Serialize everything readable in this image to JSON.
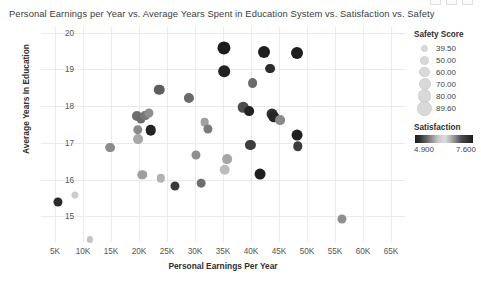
{
  "window": {
    "buttons": [
      "minimize",
      "maximize",
      "close"
    ]
  },
  "chart_data": {
    "type": "scatter",
    "title": "Personal Earnings per Year vs. Average Years Spent in Education System vs. Satisfaction vs. Safety",
    "xlabel": "Personal Earnings Per Year",
    "ylabel": "Average Years In Education",
    "xlim": [
      2500,
      67500
    ],
    "ylim": [
      14.3,
      20.15
    ],
    "grid": true,
    "xticks": [
      "5K",
      "10K",
      "15K",
      "20K",
      "25K",
      "30K",
      "35K",
      "40K",
      "45K",
      "50K",
      "55K",
      "60K",
      "65K"
    ],
    "xtick_values": [
      5000,
      10000,
      15000,
      20000,
      25000,
      30000,
      35000,
      40000,
      45000,
      50000,
      55000,
      60000,
      65000
    ],
    "yticks": [
      "15",
      "16",
      "17",
      "18",
      "19",
      "20"
    ],
    "ytick_values": [
      15,
      16,
      17,
      18,
      19,
      20
    ],
    "size_encoding": "Safety Score",
    "color_encoding": "Satisfaction",
    "points": [
      {
        "x": 5500,
        "y": 15.4,
        "size": 62,
        "color": "#2a2a2a"
      },
      {
        "x": 8600,
        "y": 15.58,
        "size": 52,
        "color": "#cdcdcd"
      },
      {
        "x": 11200,
        "y": 14.37,
        "size": 46,
        "color": "#c4c4c4"
      },
      {
        "x": 14900,
        "y": 16.87,
        "size": 66,
        "color": "#8c8c8c"
      },
      {
        "x": 19700,
        "y": 17.72,
        "size": 68,
        "color": "#6f6f6f"
      },
      {
        "x": 19800,
        "y": 17.36,
        "size": 64,
        "color": "#8a8a8a"
      },
      {
        "x": 19900,
        "y": 17.1,
        "size": 66,
        "color": "#a8a8a8"
      },
      {
        "x": 20300,
        "y": 17.64,
        "size": 62,
        "color": "#6b6b6b"
      },
      {
        "x": 21100,
        "y": 17.74,
        "size": 66,
        "color": "#787878"
      },
      {
        "x": 21800,
        "y": 17.8,
        "size": 62,
        "color": "#8f8f8f"
      },
      {
        "x": 22100,
        "y": 17.34,
        "size": 70,
        "color": "#232323"
      },
      {
        "x": 20600,
        "y": 16.13,
        "size": 64,
        "color": "#9e9e9e"
      },
      {
        "x": 23600,
        "y": 18.44,
        "size": 70,
        "color": "#5e5e5e"
      },
      {
        "x": 23900,
        "y": 16.03,
        "size": 58,
        "color": "#b2b2b2"
      },
      {
        "x": 26400,
        "y": 15.82,
        "size": 62,
        "color": "#3a3a3a"
      },
      {
        "x": 28900,
        "y": 18.22,
        "size": 68,
        "color": "#6a6a6a"
      },
      {
        "x": 30100,
        "y": 16.68,
        "size": 62,
        "color": "#8e8e8e"
      },
      {
        "x": 31100,
        "y": 15.9,
        "size": 60,
        "color": "#6e6e6e"
      },
      {
        "x": 31700,
        "y": 17.56,
        "size": 60,
        "color": "#a0a0a0"
      },
      {
        "x": 32300,
        "y": 17.38,
        "size": 62,
        "color": "#7b7b7b"
      },
      {
        "x": 35200,
        "y": 19.58,
        "size": 84,
        "color": "#1c1c1c"
      },
      {
        "x": 35200,
        "y": 18.95,
        "size": 76,
        "color": "#222222"
      },
      {
        "x": 35700,
        "y": 16.56,
        "size": 66,
        "color": "#a6a6a6"
      },
      {
        "x": 35300,
        "y": 16.26,
        "size": 70,
        "color": "#bcbcbc"
      },
      {
        "x": 38600,
        "y": 17.97,
        "size": 70,
        "color": "#4e4e4e"
      },
      {
        "x": 39700,
        "y": 17.87,
        "size": 66,
        "color": "#232323"
      },
      {
        "x": 40300,
        "y": 18.63,
        "size": 66,
        "color": "#6b6b6b"
      },
      {
        "x": 39900,
        "y": 16.95,
        "size": 68,
        "color": "#3d3d3d"
      },
      {
        "x": 42400,
        "y": 19.46,
        "size": 78,
        "color": "#1f1f1f"
      },
      {
        "x": 43400,
        "y": 19.02,
        "size": 66,
        "color": "#2c2c2c"
      },
      {
        "x": 43800,
        "y": 17.78,
        "size": 72,
        "color": "#2e2e2e"
      },
      {
        "x": 44100,
        "y": 17.71,
        "size": 74,
        "color": "#262626"
      },
      {
        "x": 45200,
        "y": 17.62,
        "size": 66,
        "color": "#8b8b8b"
      },
      {
        "x": 41600,
        "y": 16.16,
        "size": 72,
        "color": "#1e1e1e"
      },
      {
        "x": 48300,
        "y": 19.44,
        "size": 78,
        "color": "#1d1d1d"
      },
      {
        "x": 48300,
        "y": 17.22,
        "size": 72,
        "color": "#1f1f1f"
      },
      {
        "x": 48400,
        "y": 16.9,
        "size": 64,
        "color": "#3c3c3c"
      },
      {
        "x": 56300,
        "y": 14.93,
        "size": 62,
        "color": "#8f8f8f"
      }
    ]
  },
  "legend": {
    "size_title": "Safety Score",
    "size_items": [
      {
        "label": "39.50",
        "d": 5
      },
      {
        "label": "50.00",
        "d": 7
      },
      {
        "label": "60.00",
        "d": 8.5
      },
      {
        "label": "70.00",
        "d": 10
      },
      {
        "label": "80.00",
        "d": 11.5
      },
      {
        "label": "89.60",
        "d": 13
      }
    ],
    "color_title": "Satisfaction",
    "color_min": "4.900",
    "color_max": "7.600"
  }
}
